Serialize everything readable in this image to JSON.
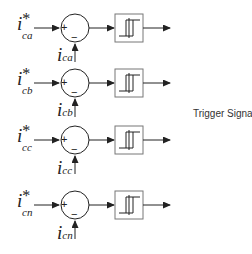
{
  "diagram": {
    "output_label": "Trigger Signals",
    "rows": [
      {
        "ref_main": "i",
        "ref_sub": "ca",
        "ref_star": "*",
        "fb_main": "i",
        "fb_sub": "ca",
        "plus": "+",
        "minus": "−"
      },
      {
        "ref_main": "i",
        "ref_sub": "cb",
        "ref_star": "*",
        "fb_main": "i",
        "fb_sub": "cb",
        "plus": "+",
        "minus": "−"
      },
      {
        "ref_main": "i",
        "ref_sub": "cc",
        "ref_star": "*",
        "fb_main": "i",
        "fb_sub": "cc",
        "plus": "+",
        "minus": "−"
      },
      {
        "ref_main": "i",
        "ref_sub": "cn",
        "ref_star": "*",
        "fb_main": "i",
        "fb_sub": "cn",
        "plus": "+",
        "minus": "−"
      }
    ],
    "colors": {
      "stroke": "#222222",
      "box_outer": "#777777"
    }
  }
}
